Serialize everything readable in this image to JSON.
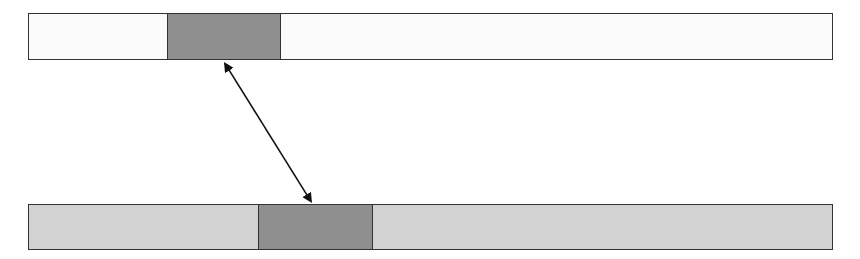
{
  "diagram": {
    "bars": [
      {
        "name": "top-bar",
        "x": 28,
        "y": 13,
        "width": 805,
        "height": 47,
        "fill": "#fbfbfb",
        "block": {
          "x_offset": 138,
          "width": 114,
          "fill": "#8f8f8f"
        }
      },
      {
        "name": "bottom-bar",
        "x": 28,
        "y": 204,
        "width": 805,
        "height": 46,
        "fill": "#d2d2d2",
        "block": {
          "x_offset": 229,
          "width": 115,
          "fill": "#8f8f8f"
        }
      }
    ],
    "arrow": {
      "type": "double-headed",
      "from": [
        224,
        62
      ],
      "to": [
        312,
        203
      ],
      "color": "#111111"
    },
    "colors": {
      "border": "#333333",
      "background": "#ffffff"
    }
  }
}
